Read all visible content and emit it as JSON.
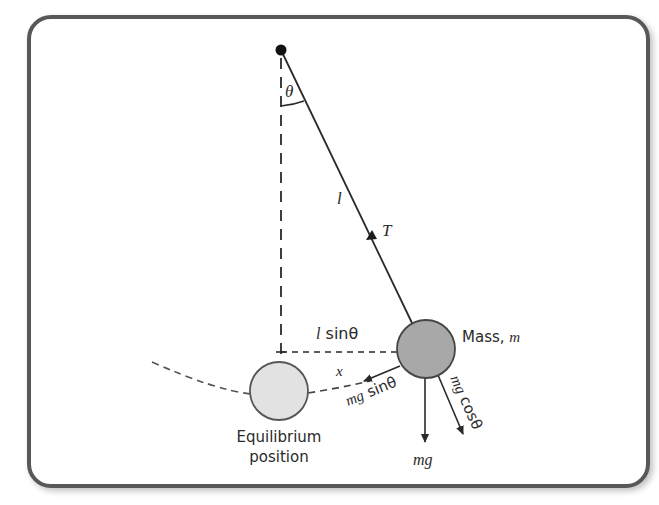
{
  "diagram": {
    "colors": {
      "frame": "#585858",
      "line": "#2a2a2a",
      "mass_fill": "#a8a8a8",
      "equilibrium_fill": "#e2e2e2",
      "text": "#2a2a2a"
    },
    "labels": {
      "theta": "θ",
      "length": "l",
      "tension": "T",
      "l_sin_theta_l": "l",
      "l_sin_theta_rest": " sinθ",
      "x": "x",
      "mass_text": "Mass, ",
      "mass_symbol": "m",
      "mg_sin_theta_mg": "mg",
      "mg_sin_theta_rest": " sinθ",
      "mg_cos_theta_mg": "mg",
      "mg_cos_theta_rest": " cosθ",
      "mg": "mg",
      "equilibrium_line1": "Equilibrium",
      "equilibrium_line2": "position"
    }
  }
}
